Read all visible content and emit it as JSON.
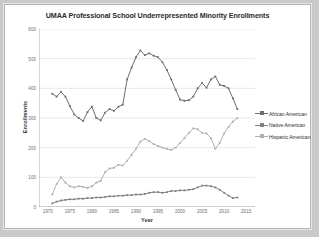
{
  "chart_data": {
    "type": "line",
    "title": "UMAA Professional School Underrepresented Minority Enrollments",
    "xlabel": "Year",
    "ylabel": "Enrollments",
    "xlim": [
      1968,
      2017
    ],
    "ylim": [
      0,
      600
    ],
    "ytick_labels": [
      "0",
      "100",
      "200",
      "300",
      "400",
      "500",
      "600"
    ],
    "ytick_values": [
      0,
      100,
      200,
      300,
      400,
      500,
      600
    ],
    "xtick_labels": [
      "1970",
      "1975",
      "1980",
      "1985",
      "1990",
      "1995",
      "2000",
      "2005",
      "2010",
      "2015"
    ],
    "xtick_values": [
      1970,
      1975,
      1980,
      1985,
      1990,
      1995,
      2000,
      2005,
      2010,
      2015
    ],
    "grid": "horizontal",
    "legend_position": "right",
    "colors": {
      "african_american": "#6e6e6e",
      "native_american": "#808080",
      "hispanic_american": "#b0b0b0",
      "gridline": "#d9d9d9",
      "axis": "#9a9a9a",
      "text": "#2b2b2b"
    },
    "series": [
      {
        "name": "African American",
        "color": "#6e6e6e",
        "x": [
          1971,
          1972,
          1973,
          1974,
          1975,
          1976,
          1977,
          1978,
          1979,
          1980,
          1981,
          1982,
          1983,
          1984,
          1985,
          1986,
          1987,
          1988,
          1989,
          1990,
          1991,
          1992,
          1993,
          1994,
          1995,
          1996,
          1997,
          1998,
          1999,
          2000,
          2001,
          2002,
          2003,
          2004,
          2005,
          2006,
          2007,
          2008,
          2009,
          2010,
          2011,
          2012,
          2013
        ],
        "values": [
          382,
          372,
          388,
          372,
          340,
          312,
          300,
          290,
          320,
          338,
          300,
          292,
          318,
          330,
          324,
          338,
          345,
          430,
          470,
          505,
          528,
          512,
          518,
          510,
          505,
          488,
          462,
          430,
          395,
          362,
          358,
          360,
          372,
          400,
          418,
          402,
          430,
          440,
          412,
          408,
          400,
          366,
          330
        ]
      },
      {
        "name": "Native American",
        "color": "#808080",
        "x": [
          1971,
          1972,
          1973,
          1974,
          1975,
          1976,
          1977,
          1978,
          1979,
          1980,
          1981,
          1982,
          1983,
          1984,
          1985,
          1986,
          1987,
          1988,
          1989,
          1990,
          1991,
          1992,
          1993,
          1994,
          1995,
          1996,
          1997,
          1998,
          1999,
          2000,
          2001,
          2002,
          2003,
          2004,
          2005,
          2006,
          2007,
          2008,
          2009,
          2010,
          2011,
          2012,
          2013
        ],
        "values": [
          12,
          18,
          22,
          24,
          26,
          26,
          28,
          28,
          30,
          30,
          32,
          32,
          34,
          36,
          36,
          38,
          38,
          40,
          40,
          42,
          42,
          44,
          48,
          50,
          50,
          48,
          50,
          54,
          54,
          56,
          56,
          58,
          60,
          66,
          72,
          72,
          70,
          66,
          58,
          48,
          38,
          30,
          32
        ]
      },
      {
        "name": "Hispanic American",
        "color": "#b0b0b0",
        "x": [
          1971,
          1972,
          1973,
          1974,
          1975,
          1976,
          1977,
          1978,
          1979,
          1980,
          1981,
          1982,
          1983,
          1984,
          1985,
          1986,
          1987,
          1988,
          1989,
          1990,
          1991,
          1992,
          1993,
          1994,
          1995,
          1996,
          1997,
          1998,
          1999,
          2000,
          2001,
          2002,
          2003,
          2004,
          2005,
          2006,
          2007,
          2008,
          2009,
          2010,
          2011,
          2012,
          2013
        ],
        "values": [
          42,
          78,
          100,
          82,
          70,
          66,
          70,
          68,
          64,
          70,
          82,
          88,
          118,
          130,
          132,
          142,
          140,
          156,
          176,
          196,
          220,
          230,
          222,
          212,
          206,
          200,
          196,
          192,
          200,
          216,
          232,
          250,
          265,
          262,
          250,
          248,
          232,
          196,
          216,
          248,
          270,
          288,
          300
        ]
      }
    ]
  },
  "legend": {
    "items": [
      {
        "label": "African American"
      },
      {
        "label": "Native American"
      },
      {
        "label": "Hispanic American"
      }
    ]
  }
}
